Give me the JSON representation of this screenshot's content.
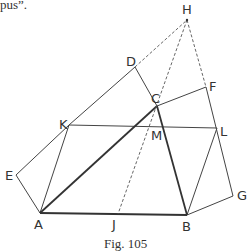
{
  "header_fragment": "pus”.",
  "caption": "Fig. 105",
  "points": {
    "H": {
      "label": "H",
      "x": 187,
      "y": 20
    },
    "D": {
      "label": "D",
      "x": 135,
      "y": 67
    },
    "C": {
      "label": "C",
      "x": 157,
      "y": 106
    },
    "F": {
      "label": "F",
      "x": 206,
      "y": 87
    },
    "K": {
      "label": "K",
      "x": 69,
      "y": 125
    },
    "M": {
      "label": "M",
      "x": 154,
      "y": 126
    },
    "L": {
      "label": "L",
      "x": 217,
      "y": 128
    },
    "E": {
      "label": "E",
      "x": 16,
      "y": 175
    },
    "A": {
      "label": "A",
      "x": 40,
      "y": 213
    },
    "J": {
      "label": "J",
      "x": 118,
      "y": 214
    },
    "B": {
      "label": "B",
      "x": 187,
      "y": 215
    },
    "G": {
      "label": "G",
      "x": 233,
      "y": 196
    }
  },
  "segments": {
    "thick": [
      [
        "A",
        "B"
      ],
      [
        "A",
        "C"
      ],
      [
        "C",
        "B"
      ]
    ],
    "solid": [
      [
        "A",
        "E"
      ],
      [
        "E",
        "K"
      ],
      [
        "K",
        "D"
      ],
      [
        "D",
        "C"
      ],
      [
        "C",
        "F"
      ],
      [
        "F",
        "G"
      ],
      [
        "G",
        "B"
      ],
      [
        "A",
        "K"
      ],
      [
        "K",
        "L"
      ],
      [
        "L",
        "B"
      ]
    ],
    "dashed": [
      [
        "D",
        "H"
      ],
      [
        "H",
        "J"
      ],
      [
        "H",
        "F"
      ]
    ]
  }
}
